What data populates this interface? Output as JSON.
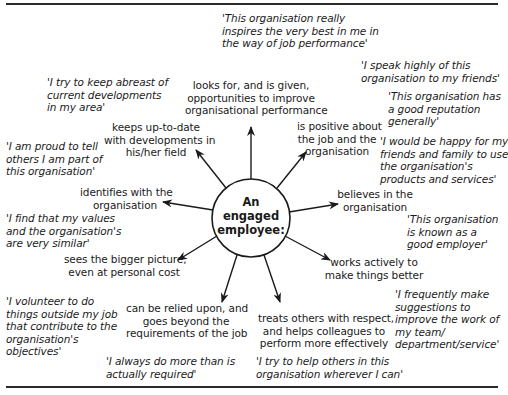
{
  "center": {
    "lines": [
      "An",
      "engaged",
      "employee:"
    ]
  },
  "behaviours": [
    {
      "id": "opportunities",
      "lines": [
        "looks for, and is given,",
        "opportunities to improve",
        "organisational performance"
      ]
    },
    {
      "id": "positive",
      "lines": [
        "is positive about",
        "the job and the",
        "organisation"
      ]
    },
    {
      "id": "believes",
      "lines": [
        "believes in the",
        "organisation"
      ]
    },
    {
      "id": "works-actively",
      "lines": [
        "works actively to",
        "make things better"
      ]
    },
    {
      "id": "treats-others",
      "lines": [
        "treats others with respect,",
        "and helps colleagues to",
        "perform more effectively"
      ]
    },
    {
      "id": "relied-upon",
      "lines": [
        "can be relied upon, and",
        "goes beyond the",
        "requirements of the job"
      ]
    },
    {
      "id": "bigger-picture",
      "lines": [
        "sees the bigger picture,",
        "even at personal cost"
      ]
    },
    {
      "id": "identifies",
      "lines": [
        "identifies with the",
        "organisation"
      ]
    },
    {
      "id": "up-to-date",
      "lines": [
        "keeps up-to-date",
        "with developments in",
        "his/her field"
      ]
    }
  ],
  "quotes": [
    {
      "id": "inspires",
      "lines": [
        "'This organisation really",
        "inspires the very best in me in",
        "the way of job performance'"
      ]
    },
    {
      "id": "speak-highly",
      "lines": [
        "'I speak highly of this",
        "organisation to my friends'"
      ]
    },
    {
      "id": "reputation",
      "lines": [
        "'This organisation has",
        "a good reputation",
        "generally'"
      ]
    },
    {
      "id": "happy-family",
      "lines": [
        "'I would be happy for my",
        "friends and family to use",
        "the organisation's",
        "products and services'"
      ]
    },
    {
      "id": "good-employer",
      "lines": [
        "'This organisation",
        "is known as a",
        "good employer'"
      ]
    },
    {
      "id": "suggestions",
      "lines": [
        "'I frequently make",
        "suggestions to",
        "improve the work of",
        "my team/",
        "department/service'"
      ]
    },
    {
      "id": "help-others",
      "lines": [
        "'I try to help others in this",
        "organisation wherever I can'"
      ]
    },
    {
      "id": "do-more",
      "lines": [
        "'I always do more than is",
        "actually required'"
      ]
    },
    {
      "id": "volunteer",
      "lines": [
        "'I volunteer to do",
        "things outside my job",
        "that contribute to the",
        "organisation's",
        "objectives'"
      ]
    },
    {
      "id": "values-similar",
      "lines": [
        "'I find that my values",
        "and the organisation's",
        "are very similar'"
      ]
    },
    {
      "id": "proud",
      "lines": [
        "'I am proud to tell",
        "others I am part of",
        "this organisation'"
      ]
    },
    {
      "id": "abreast",
      "lines": [
        "'I try to keep abreast of",
        "current developments",
        "in my area'"
      ]
    }
  ],
  "colors": {
    "ink": "#1a1a1a",
    "rule": "#2a2a2a",
    "background": "#ffffff"
  }
}
